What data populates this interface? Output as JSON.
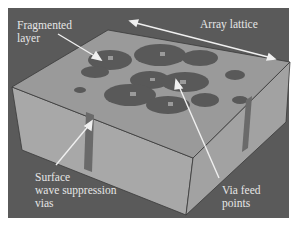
{
  "figure": {
    "background_color": "#5a5a5a",
    "top_face_color": "#9a9a9a",
    "side_face_color": "#a6a6a6",
    "patch_color": "#555555",
    "arrow_color": "#f0f0f0",
    "labels": {
      "fragmented_layer": "Fragmented\nlayer",
      "array_lattice": "Array lattice",
      "surface_wave_vias": "Surface\nwave suppression\nvias",
      "via_feed_points": "Via feed\npoints"
    }
  }
}
